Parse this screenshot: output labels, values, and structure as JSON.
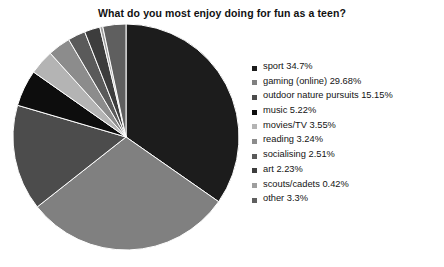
{
  "chart_data": {
    "type": "pie",
    "title": "What do you most enjoy doing for fun as a teen?",
    "xlabel": "",
    "ylabel": "",
    "legend_position": "right",
    "grid": false,
    "start_angle_deg": 0,
    "direction": "clockwise",
    "categories": [
      "sport",
      "gaming (online)",
      "outdoor nature pursuits",
      "music",
      "movies/TV",
      "reading",
      "socialising",
      "art",
      "scouts/cadets",
      "other"
    ],
    "values": [
      34.7,
      29.68,
      15.15,
      5.22,
      3.55,
      3.24,
      2.51,
      2.23,
      0.42,
      3.3
    ],
    "value_unit": "%",
    "slices": [
      {
        "label": "sport",
        "value": 34.7,
        "display": "sport 34.7%",
        "color": "#1c1c1c"
      },
      {
        "label": "gaming (online)",
        "value": 29.68,
        "display": "gaming (online) 29.68%",
        "color": "#808080"
      },
      {
        "label": "outdoor nature pursuits",
        "value": 15.15,
        "display": "outdoor nature pursuits 15.15%",
        "color": "#4c4c4c"
      },
      {
        "label": "music",
        "value": 5.22,
        "display": "music 5.22%",
        "color": "#0d0d0d"
      },
      {
        "label": "movies/TV",
        "value": 3.55,
        "display": "movies/TV 3.55%",
        "color": "#b4b4b4"
      },
      {
        "label": "reading",
        "value": 3.24,
        "display": "reading 3.24%",
        "color": "#8c8c8c"
      },
      {
        "label": "socialising",
        "value": 2.51,
        "display": "socialising 2.51%",
        "color": "#5a5a5a"
      },
      {
        "label": "art",
        "value": 2.23,
        "display": "art 2.23%",
        "color": "#3d3d3d"
      },
      {
        "label": "scouts/cadets",
        "value": 0.42,
        "display": "scouts/cadets 0.42%",
        "color": "#9e9e9e"
      },
      {
        "label": "other",
        "value": 3.3,
        "display": "other 3.3%",
        "color": "#5f5f5f"
      }
    ]
  },
  "legend": {
    "items": [
      {
        "text": "sport 34.7%",
        "color": "#1c1c1c"
      },
      {
        "text": "gaming (online) 29.68%",
        "color": "#808080"
      },
      {
        "text": "outdoor nature pursuits 15.15%",
        "color": "#4c4c4c"
      },
      {
        "text": "music 5.22%",
        "color": "#0d0d0d"
      },
      {
        "text": "movies/TV 3.55%",
        "color": "#b4b4b4"
      },
      {
        "text": "reading 3.24%",
        "color": "#8c8c8c"
      },
      {
        "text": "socialising 2.51%",
        "color": "#5a5a5a"
      },
      {
        "text": "art 2.23%",
        "color": "#3d3d3d"
      },
      {
        "text": "scouts/cadets 0.42%",
        "color": "#9e9e9e"
      },
      {
        "text": "other 3.3%",
        "color": "#5f5f5f"
      }
    ]
  },
  "page": {
    "background": "#ffffff",
    "text_color": "#1a1a1a"
  }
}
